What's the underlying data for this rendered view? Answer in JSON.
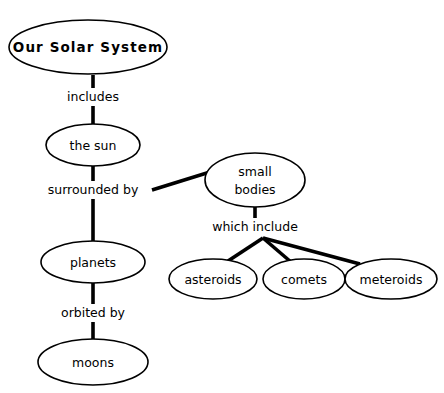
{
  "diagram": {
    "type": "concept-map",
    "title": "Our Solar System",
    "background_color": "#ffffff",
    "line_color": "#000000",
    "nodes": [
      {
        "id": "solar-system",
        "label": "Our Solar System",
        "lines": [
          "Our Solar System"
        ],
        "cx": 88,
        "cy": 47,
        "rx": 79,
        "ry": 27,
        "emphasis": "bold"
      },
      {
        "id": "the-sun",
        "label": "the sun",
        "lines": [
          "the sun"
        ],
        "cx": 93,
        "cy": 145,
        "rx": 47,
        "ry": 21,
        "emphasis": "normal"
      },
      {
        "id": "planets",
        "label": "planets",
        "lines": [
          "planets"
        ],
        "cx": 93,
        "cy": 262,
        "rx": 52,
        "ry": 21,
        "emphasis": "normal"
      },
      {
        "id": "moons",
        "label": "moons",
        "lines": [
          "moons"
        ],
        "cx": 93,
        "cy": 362,
        "rx": 55,
        "ry": 23,
        "emphasis": "normal"
      },
      {
        "id": "small-bodies",
        "label": "small bodies",
        "lines": [
          "small",
          "bodies"
        ],
        "cx": 255,
        "cy": 180,
        "rx": 50,
        "ry": 27,
        "emphasis": "normal"
      },
      {
        "id": "asteroids",
        "label": "asteroids",
        "lines": [
          "asteroids"
        ],
        "cx": 213,
        "cy": 279,
        "rx": 44,
        "ry": 20,
        "emphasis": "normal"
      },
      {
        "id": "comets",
        "label": "comets",
        "lines": [
          "comets"
        ],
        "cx": 304,
        "cy": 279,
        "rx": 41,
        "ry": 20,
        "emphasis": "normal"
      },
      {
        "id": "meteroids",
        "label": "meteroids",
        "lines": [
          "meteroids"
        ],
        "cx": 391,
        "cy": 279,
        "rx": 46,
        "ry": 20,
        "emphasis": "normal"
      }
    ],
    "links": [
      {
        "id": "includes",
        "label": "includes",
        "from": "solar-system",
        "to": "the-sun",
        "x": 93,
        "y": 97
      },
      {
        "id": "surrounded-by",
        "label": "surrounded by",
        "from": "the-sun",
        "to": "planets",
        "x": 93,
        "y": 190
      },
      {
        "id": "orbited-by",
        "label": "orbited by",
        "from": "planets",
        "to": "moons",
        "x": 93,
        "y": 313
      },
      {
        "id": "which-include",
        "label": "which include",
        "from": "small-bodies",
        "to": "asteroids, comets, meteroids",
        "x": 255,
        "y": 227
      }
    ]
  }
}
